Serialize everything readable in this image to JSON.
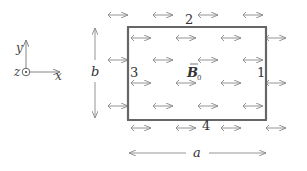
{
  "diagram": {
    "axes": {
      "x_label": "x",
      "y_label": "y",
      "z_label": "z",
      "z_symbol": "out-of-page-dot"
    },
    "loop": {
      "sides": [
        {
          "id": "1",
          "label": "1",
          "position": "right"
        },
        {
          "id": "2",
          "label": "2",
          "position": "top"
        },
        {
          "id": "3",
          "label": "3",
          "position": "left"
        },
        {
          "id": "4",
          "label": "4",
          "position": "bottom"
        }
      ],
      "width_label": "a",
      "height_label": "b"
    },
    "field": {
      "symbol": "B",
      "subscript": "0",
      "direction": "+x",
      "arrow_rows": 6,
      "arrows_per_row": 4
    },
    "colors": {
      "loop_stroke": "#666666",
      "arrow_stroke": "#888888",
      "text": "#333333"
    }
  }
}
